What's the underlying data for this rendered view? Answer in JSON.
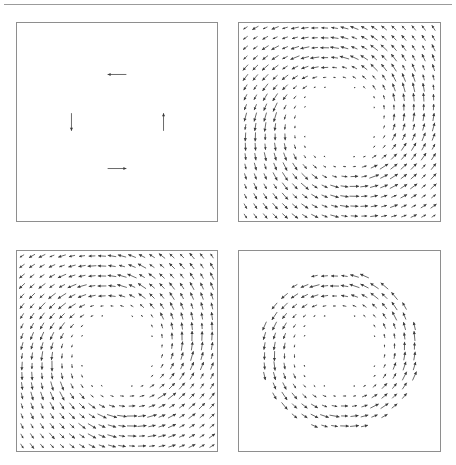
{
  "figure": {
    "title": "",
    "panel_count": 4,
    "layout": "2x2 grid",
    "background_color": "#ffffff",
    "arrow_color": "#3a3a3a",
    "border_color": "#8e8e8e",
    "rule_color": "#9b9b9b"
  },
  "panels": [
    {
      "id": "a",
      "position": "top-left",
      "description": "sparse vector field, four arrows in rotational arrangement",
      "grid": 20,
      "hole_radius": 0.3,
      "outer_radius": 1.1,
      "mode": "sparse",
      "rotation": 0,
      "scale": 0.1,
      "swirl": 1.0,
      "radial": 0.0,
      "seed": 11
    },
    {
      "id": "b",
      "position": "top-right",
      "description": "dense vector field, vortex with empty central disk",
      "grid": 20,
      "hole_radius": 0.34,
      "outer_radius": 1.6,
      "mode": "dense",
      "rotation": 0,
      "scale": 1.0,
      "swirl": 1.0,
      "radial": 0.22,
      "seed": 23
    },
    {
      "id": "c",
      "position": "bottom-left",
      "description": "dense vector field, vortex mirrored relative to top-right panel",
      "grid": 20,
      "hole_radius": 0.34,
      "outer_radius": 1.6,
      "mode": "dense",
      "rotation": 90,
      "scale": 1.0,
      "swirl": 1.0,
      "radial": 0.22,
      "seed": 37
    },
    {
      "id": "d",
      "position": "bottom-right",
      "description": "annular ring of vectors, blank center and blank corners",
      "grid": 20,
      "hole_radius": 0.34,
      "outer_radius": 0.8,
      "mode": "ring",
      "rotation": 0,
      "scale": 1.0,
      "swirl": 1.0,
      "radial": 0.1,
      "seed": 53
    }
  ],
  "chart_data": {
    "type": "scatter",
    "subtype": "quiver / vector-field",
    "title": "",
    "xlabel": "",
    "ylabel": "",
    "xlim": [
      -1,
      1
    ],
    "ylim": [
      -1,
      1
    ],
    "grid": false,
    "legend": null,
    "panels": [
      {
        "name": "a",
        "vectors": [
          {
            "x": 0.0,
            "y": 0.48,
            "u": -0.18,
            "v": 0.0,
            "direction": "left"
          },
          {
            "x": -0.46,
            "y": 0.0,
            "u": 0.0,
            "v": -0.17,
            "direction": "down"
          },
          {
            "x": 0.47,
            "y": 0.0,
            "u": 0.0,
            "v": 0.17,
            "direction": "up"
          },
          {
            "x": 0.0,
            "y": -0.47,
            "u": 0.18,
            "v": 0.0,
            "direction": "right"
          }
        ]
      },
      {
        "name": "b",
        "field": "counter-clockwise swirl plus weak outward radial component; magnitude vanishes inside r<0.34",
        "vector_count": 400
      },
      {
        "name": "c",
        "field": "counter-clockwise swirl plus weak outward radial component, rotated 90 degrees relative to panel b",
        "vector_count": 400
      },
      {
        "name": "d",
        "field": "counter-clockwise swirl restricted to annulus 0.34 < r < 0.80",
        "vector_count": 400
      }
    ]
  }
}
